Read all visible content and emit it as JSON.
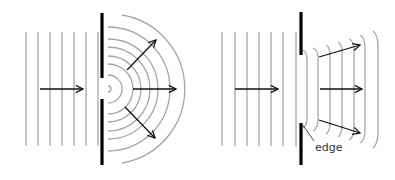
{
  "figure": {
    "colors": {
      "background": "#ffffff",
      "wave": "#a6a6a6",
      "barrier": "#000000",
      "arrow": "#111111",
      "label": "#333333"
    }
  },
  "left_panel": {
    "name": "narrow-gap-diffraction",
    "incident_wave_x": [
      26,
      38,
      50,
      62,
      74,
      86,
      98
    ],
    "incident_wave_y": [
      32,
      146
    ],
    "barrier": {
      "x": 102,
      "top": [
        13,
        78
      ],
      "bottom": [
        99,
        165
      ]
    },
    "source_center": [
      108,
      89
    ],
    "arc_radii": [
      3,
      14,
      25,
      33,
      42,
      50,
      62,
      75
    ]
  },
  "right_panel": {
    "name": "wide-gap-diffraction",
    "incident_wave_x": [
      222,
      235,
      247,
      259,
      271,
      283,
      296
    ],
    "incident_wave_y": [
      32,
      146
    ],
    "barrier": {
      "x": 301,
      "top": [
        12,
        55
      ],
      "bottom": [
        123,
        165
      ]
    },
    "edge_label": "edge"
  },
  "labels": {
    "edge": "edge"
  }
}
